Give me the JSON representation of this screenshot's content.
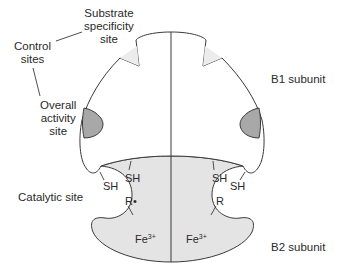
{
  "labels": {
    "substrate_specificity_site": [
      "Substrate",
      "specificity",
      "site"
    ],
    "control_sites": [
      "Control",
      "sites"
    ],
    "overall_activity_site": [
      "Overall",
      "activity",
      "site"
    ],
    "catalytic_site": "Catalytic site",
    "b1_subunit": "B1 subunit",
    "b2_subunit": "B2 subunit",
    "sh": "SH",
    "r_radical": "R•",
    "r": "R",
    "fe_base": "Fe",
    "fe_charge": "3+"
  },
  "colors": {
    "line": "#3a3a3a",
    "b2_fill": "#e4e4e4",
    "activity_site_fill": "#a8a8a8",
    "specificity_site_fill": "#ececec"
  }
}
